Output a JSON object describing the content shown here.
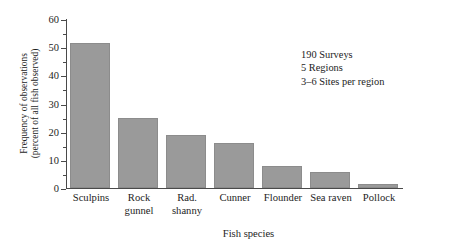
{
  "chart_data": {
    "type": "bar",
    "title": "",
    "xlabel": "Fish species",
    "ylabel_line1": "Frequency of observations",
    "ylabel_line2": "(percent of all fish observed)",
    "categories": [
      "Sculpins",
      "Rock gunnel",
      "Rad. shanny",
      "Cunner",
      "Flounder",
      "Sea raven",
      "Pollock"
    ],
    "category_lines": [
      [
        "Sculpins"
      ],
      [
        "Rock",
        "gunnel"
      ],
      [
        "Rad.",
        "shanny"
      ],
      [
        "Cunner"
      ],
      [
        "Flounder"
      ],
      [
        "Sea raven"
      ],
      [
        "Pollock"
      ]
    ],
    "values": [
      51.5,
      24.8,
      18.8,
      16.0,
      7.7,
      5.8,
      1.6
    ],
    "ylim": [
      0,
      60
    ],
    "ytick_labels": [
      "0",
      "10",
      "20",
      "30",
      "40",
      "50",
      "60"
    ],
    "ytick_values": [
      0,
      10,
      20,
      30,
      40,
      50,
      60
    ],
    "yminor_values": [
      5,
      15,
      25,
      35,
      45,
      55
    ],
    "grid": false,
    "legend": "none",
    "bar_color": "#9a9a9a",
    "bar_edge_color": "#8c8c8c",
    "axis_color": "#4a4a4a"
  },
  "annotation": {
    "line1": "190 Surveys",
    "line2": "5 Regions",
    "line3": "3–6 Sites per region"
  }
}
